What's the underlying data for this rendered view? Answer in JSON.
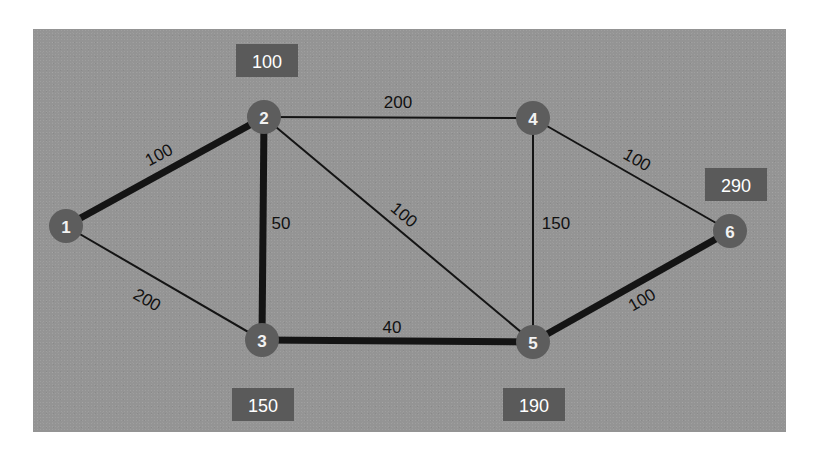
{
  "figure": {
    "kind": "network-diagram",
    "background_color": "#ffffff",
    "panel_color": "#949494",
    "node_color": "#5d5d5d",
    "node_text_color": "#f2f2f2",
    "edge_color": "#141414",
    "badge_color": "#5a5a5a",
    "badge_text_color": "#ffffff"
  },
  "chart_data": {
    "type": "diagram",
    "title": "",
    "xlabel": "",
    "ylabel": "",
    "nodes": [
      {
        "id": "1",
        "label": "1",
        "x": 66,
        "y": 226,
        "r": 17
      },
      {
        "id": "2",
        "label": "2",
        "x": 264,
        "y": 117,
        "r": 17
      },
      {
        "id": "3",
        "label": "3",
        "x": 262,
        "y": 340,
        "r": 17
      },
      {
        "id": "4",
        "label": "4",
        "x": 533,
        "y": 118,
        "r": 17
      },
      {
        "id": "5",
        "label": "5",
        "x": 533,
        "y": 342,
        "r": 17
      },
      {
        "id": "6",
        "label": "6",
        "x": 730,
        "y": 231,
        "r": 17
      }
    ],
    "edges": [
      {
        "from": "1",
        "to": "2",
        "label": "100",
        "weight": 100,
        "width": 7,
        "lx": 159,
        "ly": 155,
        "rot": -28
      },
      {
        "from": "1",
        "to": "3",
        "label": "200",
        "weight": 200,
        "width": 2,
        "lx": 147,
        "ly": 300,
        "rot": 30
      },
      {
        "from": "2",
        "to": "3",
        "label": "50",
        "weight": 50,
        "width": 7,
        "lx": 281,
        "ly": 223,
        "rot": 0
      },
      {
        "from": "2",
        "to": "4",
        "label": "200",
        "weight": 200,
        "width": 2,
        "lx": 398,
        "ly": 102,
        "rot": 0
      },
      {
        "from": "2",
        "to": "5",
        "label": "100",
        "weight": 100,
        "width": 2,
        "lx": 404,
        "ly": 215,
        "rot": 40
      },
      {
        "from": "3",
        "to": "5",
        "label": "40",
        "weight": 40,
        "width": 7,
        "lx": 392,
        "ly": 327,
        "rot": 0
      },
      {
        "from": "4",
        "to": "5",
        "label": "150",
        "weight": 150,
        "width": 2,
        "lx": 556,
        "ly": 223,
        "rot": 0
      },
      {
        "from": "4",
        "to": "6",
        "label": "100",
        "weight": 100,
        "width": 2,
        "lx": 637,
        "ly": 160,
        "rot": 30
      },
      {
        "from": "5",
        "to": "6",
        "label": "100",
        "weight": 100,
        "width": 7,
        "lx": 642,
        "ly": 300,
        "rot": -30
      }
    ],
    "badges": [
      {
        "id": "badge-node-2",
        "label": "100",
        "value": 100,
        "x": 236,
        "y": 44,
        "w": 62,
        "h": 33,
        "for_node": "2"
      },
      {
        "id": "badge-node-6",
        "label": "290",
        "value": 290,
        "x": 705,
        "y": 168,
        "w": 62,
        "h": 33,
        "for_node": "6"
      },
      {
        "id": "badge-node-3",
        "label": "150",
        "value": 150,
        "x": 232,
        "y": 388,
        "w": 62,
        "h": 33,
        "for_node": "3"
      },
      {
        "id": "badge-node-5",
        "label": "190",
        "value": 190,
        "x": 503,
        "y": 388,
        "w": 62,
        "h": 33,
        "for_node": "5"
      }
    ]
  }
}
